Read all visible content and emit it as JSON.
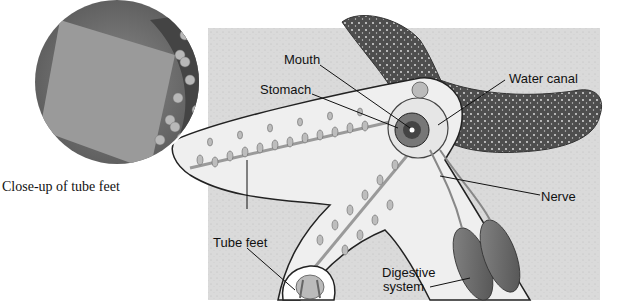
{
  "figure": {
    "inset_caption": "Close-up of tube feet",
    "labels": [
      {
        "id": "mouth",
        "text": "Mouth"
      },
      {
        "id": "stomach",
        "text": "Stomach"
      },
      {
        "id": "water_canal",
        "text": "Water canal"
      },
      {
        "id": "nerve",
        "text": "Nerve"
      },
      {
        "id": "tube_feet",
        "text": "Tube feet"
      },
      {
        "id": "digestive_system_line1",
        "text": "Digestive"
      },
      {
        "id": "digestive_system_line2",
        "text": "system"
      }
    ]
  },
  "colors": {
    "background_sand": "#dcdcdc",
    "starfish_skin": "#555555",
    "cutaway_body": "#eeeeee",
    "inset_photo": "#7a7a7a",
    "leader_line": "#111111"
  }
}
